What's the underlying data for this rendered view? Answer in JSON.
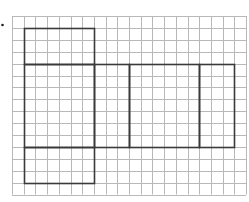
{
  "diagram": {
    "type": "net-on-grid",
    "marker": {
      "x": 2.5,
      "y": 25,
      "color": "#222222"
    },
    "grid": {
      "origin_x": 12,
      "origin_y": 16,
      "cols": 20,
      "rows": 15,
      "cell_w": 11.7,
      "cell_h": 11.9,
      "line_color": "#b8b8b8",
      "line_width": 1
    },
    "outline": {
      "color": "#3a3a3a",
      "width": 1.6
    },
    "faces": [
      {
        "name": "top-face",
        "col": 1,
        "row": 1,
        "w": 6,
        "h": 3
      },
      {
        "name": "front-face",
        "col": 1,
        "row": 4,
        "w": 6,
        "h": 7
      },
      {
        "name": "right-face",
        "col": 7,
        "row": 4,
        "w": 3,
        "h": 7
      },
      {
        "name": "back-face",
        "col": 10,
        "row": 4,
        "w": 6,
        "h": 7
      },
      {
        "name": "left-face",
        "col": 16,
        "row": 4,
        "w": 3,
        "h": 7
      },
      {
        "name": "bottom-face",
        "col": 1,
        "row": 11,
        "w": 6,
        "h": 3
      }
    ]
  }
}
